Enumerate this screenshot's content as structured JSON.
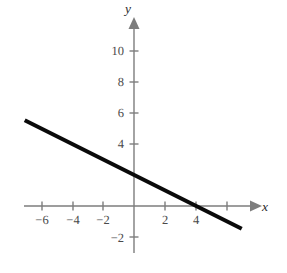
{
  "chart_data": {
    "type": "line",
    "title": "",
    "subtitle": "",
    "xlabel": "x",
    "ylabel": "y",
    "xlim": [
      -7.1,
      7.7
    ],
    "ylim": [
      -3.3,
      11.9
    ],
    "grid": false,
    "legend": null,
    "annotations": [],
    "axes": {
      "origin_label": "",
      "x_ticks": [
        -6,
        -4,
        -2,
        2,
        4,
        6
      ],
      "x_tick_labels": [
        "−6",
        "−4",
        "−2",
        "2",
        "4",
        ""
      ],
      "y_ticks": [
        -2,
        4,
        6,
        8,
        10
      ],
      "y_tick_labels": [
        "−2",
        "4",
        "6",
        "8",
        "10"
      ],
      "x_arrow": true,
      "y_arrow": true
    },
    "series": [
      {
        "name": "line",
        "equation": "y = -0.5x + 2",
        "slope": -0.5,
        "intercept": 2,
        "x_intercept": 4,
        "y_intercept": 2,
        "color": "#0a0a0a",
        "width_px": 4,
        "x": [
          -7.05,
          6.95
        ],
        "values": [
          5.53,
          -1.47
        ]
      }
    ]
  },
  "labels": {
    "x_axis_name": "x",
    "y_axis_name": "y",
    "x_minus6": "−6",
    "x_minus4": "−4",
    "x_minus2": "−2",
    "x_2": "2",
    "x_4": "4",
    "y_minus2": "−2",
    "y_4": "4",
    "y_6": "6",
    "y_8": "8",
    "y_10": "10"
  },
  "colors": {
    "background": "#ffffff",
    "axis": "#7d7d7d",
    "tick_text": "#4a4a4a",
    "data_line": "#0a0a0a",
    "axis_name": "#2b2b2b"
  }
}
